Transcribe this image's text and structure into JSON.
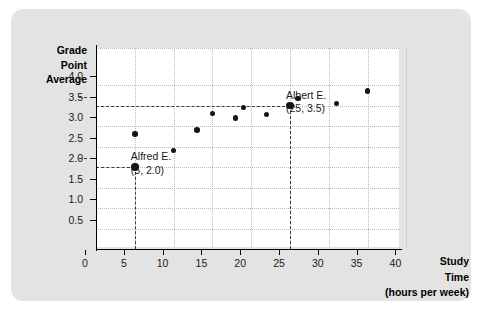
{
  "chart_data": {
    "type": "scatter",
    "title": "",
    "xlabel": "Study Time (hours per week)",
    "ylabel": "Grade Point Average",
    "xlabel_lines": [
      "Study",
      "Time",
      "(hours per week)"
    ],
    "ylabel_lines": [
      "Grade",
      "Point",
      "Average"
    ],
    "xlim": [
      0,
      42
    ],
    "ylim": [
      0,
      4.25
    ],
    "xticks": [
      0,
      5,
      10,
      15,
      20,
      25,
      30,
      35,
      40
    ],
    "xtick_labels": [
      "0",
      "5",
      "10",
      "15",
      "20",
      "25",
      "30",
      "35",
      "40"
    ],
    "yticks": [
      0.5,
      1.0,
      1.5,
      2.0,
      2.5,
      3.0,
      3.5,
      4.0
    ],
    "ytick_labels": [
      "0.5",
      "1.0",
      "1.5",
      "2.0",
      "2.5",
      "3.0",
      "3.5",
      "4.0"
    ],
    "grid": "dotted",
    "legend": "none",
    "marker_color": "#151515",
    "points": [
      {
        "x": 5,
        "y": 2.0,
        "highlight": true,
        "label": "Alfred E."
      },
      {
        "x": 5,
        "y": 2.8,
        "highlight": false
      },
      {
        "x": 10,
        "y": 2.4,
        "highlight": false
      },
      {
        "x": 13,
        "y": 2.9,
        "highlight": false
      },
      {
        "x": 15,
        "y": 3.3,
        "highlight": false
      },
      {
        "x": 18,
        "y": 3.2,
        "highlight": false
      },
      {
        "x": 19,
        "y": 3.45,
        "highlight": false
      },
      {
        "x": 22,
        "y": 3.28,
        "highlight": false
      },
      {
        "x": 25,
        "y": 3.5,
        "highlight": true,
        "label": "Albert E."
      },
      {
        "x": 26,
        "y": 3.67,
        "highlight": false
      },
      {
        "x": 31,
        "y": 3.55,
        "highlight": false
      },
      {
        "x": 35,
        "y": 3.85,
        "highlight": false
      }
    ],
    "annotations": [
      {
        "name": "Alfred E.",
        "coords": "(5, 2.0)",
        "x": 5,
        "y": 2.0
      },
      {
        "name": "Albert E.",
        "coords": "(25, 3.5)",
        "x": 25,
        "y": 3.5
      }
    ],
    "guide_lines": [
      {
        "axis": "vertical",
        "at": 5,
        "to": 2.0,
        "style": "dashed"
      },
      {
        "axis": "horizontal",
        "at": 2.0,
        "to": 5,
        "style": "dashed"
      },
      {
        "axis": "vertical",
        "at": 25,
        "to": 3.5,
        "style": "dashed"
      },
      {
        "axis": "horizontal",
        "at": 3.5,
        "to": 25,
        "style": "dashed"
      }
    ]
  },
  "colors": {
    "card_background": "#e3e3e3",
    "plot_background": "#ffffff",
    "axis": "#000000",
    "grid": "#b9b9b9",
    "marker": "#151515",
    "text": "#1a1a1a"
  }
}
